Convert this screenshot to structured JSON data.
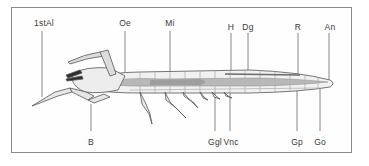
{
  "diagram": {
    "colors": {
      "frame": "#8a8a8a",
      "outline": "#555555",
      "body_fill": "#f1f1f1",
      "gut_fill": "#b8b8b8",
      "dark_fill": "#3a3a3a",
      "leader_line": "#6a6a6a",
      "label": "#3a3a3a"
    },
    "labels_top": [
      {
        "id": "1stAl",
        "text": "1stAl",
        "x": 44,
        "y": 19
      },
      {
        "id": "Oe",
        "text": "Oe",
        "x": 125,
        "y": 19
      },
      {
        "id": "Mi",
        "text": "Mi",
        "x": 170,
        "y": 19
      },
      {
        "id": "H",
        "text": "H",
        "x": 231,
        "y": 23
      },
      {
        "id": "Dg",
        "text": "Dg",
        "x": 248,
        "y": 23
      },
      {
        "id": "R",
        "text": "R",
        "x": 298,
        "y": 23
      },
      {
        "id": "An",
        "text": "An",
        "x": 330,
        "y": 23
      }
    ],
    "labels_bottom": [
      {
        "id": "B",
        "text": "B",
        "x": 91,
        "y": 138
      },
      {
        "id": "Ggl",
        "text": "Ggl",
        "x": 215,
        "y": 138
      },
      {
        "id": "Vnc",
        "text": "Vnc",
        "x": 231,
        "y": 138
      },
      {
        "id": "Gp",
        "text": "Gp",
        "x": 297,
        "y": 138
      },
      {
        "id": "Go",
        "text": "Go",
        "x": 320,
        "y": 138
      }
    ]
  }
}
